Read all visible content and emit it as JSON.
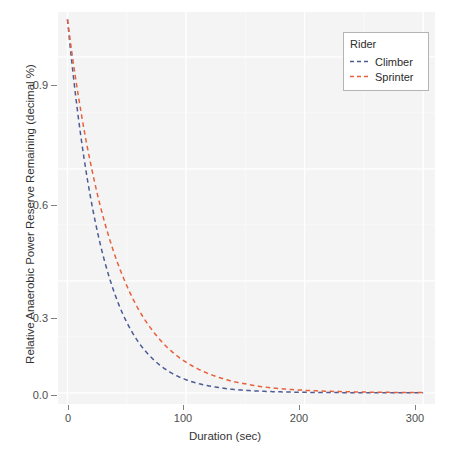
{
  "chart_data": {
    "type": "line",
    "title": "",
    "xlabel": "Duration (sec)",
    "ylabel": "Relative Anaerobic Power Reserve Remaining (decimal %)",
    "xlim": [
      -8,
      310
    ],
    "ylim": [
      -0.03,
      1.02
    ],
    "xticks": [
      0,
      100,
      200,
      300
    ],
    "xtick_labels": [
      "0",
      "100",
      "200",
      "300"
    ],
    "yticks": [
      0.0,
      0.3,
      0.6,
      0.9
    ],
    "ytick_labels": [
      "0.0",
      "0.3",
      "0.6",
      "0.9"
    ],
    "grid": true,
    "grid_color": "#ffffff",
    "panel_background": "#f4f4f4",
    "legend": {
      "title": "Rider",
      "position": "top-right",
      "entries": [
        {
          "label": "Climber",
          "color": "#4c5b94",
          "dash": "dashed"
        },
        {
          "label": "Sprinter",
          "color": "#e8613c",
          "dash": "dashed"
        }
      ]
    },
    "series": [
      {
        "name": "Climber",
        "color": "#4c5b94",
        "dash": "dashed",
        "x": [
          0,
          5,
          10,
          15,
          20,
          25,
          30,
          35,
          40,
          45,
          50,
          60,
          70,
          80,
          90,
          100,
          110,
          120,
          130,
          140,
          150,
          160,
          170,
          180,
          190,
          200,
          210,
          220,
          230,
          240,
          250,
          260,
          270,
          280,
          290,
          300
        ],
        "y": [
          1.0,
          0.847,
          0.717,
          0.607,
          0.514,
          0.435,
          0.368,
          0.312,
          0.264,
          0.223,
          0.189,
          0.135,
          0.097,
          0.069,
          0.049,
          0.035,
          0.025,
          0.018,
          0.013,
          0.009,
          0.0067,
          0.0048,
          0.0034,
          0.0025,
          0.0018,
          0.0012,
          0.0009,
          0.0006,
          0.0005,
          0.0003,
          0.0002,
          0.0002,
          0.0001,
          0.0001,
          0.0001,
          0.0
        ]
      },
      {
        "name": "Sprinter",
        "color": "#e8613c",
        "dash": "dashed",
        "x": [
          0,
          5,
          10,
          15,
          20,
          25,
          30,
          35,
          40,
          45,
          50,
          60,
          70,
          80,
          90,
          100,
          110,
          120,
          130,
          140,
          150,
          160,
          170,
          180,
          190,
          200,
          210,
          220,
          230,
          240,
          250,
          260,
          270,
          280,
          290,
          300
        ],
        "y": [
          1.0,
          0.882,
          0.779,
          0.687,
          0.607,
          0.535,
          0.472,
          0.417,
          0.368,
          0.325,
          0.287,
          0.223,
          0.174,
          0.135,
          0.105,
          0.082,
          0.064,
          0.05,
          0.039,
          0.03,
          0.024,
          0.018,
          0.014,
          0.011,
          0.0086,
          0.0067,
          0.0052,
          0.0041,
          0.0032,
          0.0025,
          0.0019,
          0.0015,
          0.0012,
          0.0009,
          0.0007,
          0.0006
        ]
      }
    ]
  }
}
